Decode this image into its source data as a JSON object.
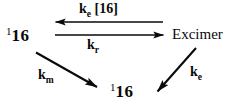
{
  "diagram": {
    "type": "reaction-scheme",
    "background_color": "#ffffff",
    "ink_color": "#0a0a0a",
    "width": 232,
    "height": 106,
    "species": {
      "left": {
        "superscript": "1",
        "body": "16"
      },
      "right": {
        "text": "Excimer"
      },
      "bottom": {
        "superscript": "1",
        "body": "16"
      }
    },
    "rate_labels": {
      "excimer_formation": {
        "symbol": "k",
        "subscript": "e",
        "bracket": "[16]"
      },
      "excimer_dissociation": {
        "symbol": "k",
        "subscript": "r"
      },
      "monomer_decay": {
        "symbol": "k",
        "subscript": "m"
      },
      "excimer_decay": {
        "symbol": "k",
        "subscript": "e"
      }
    },
    "arrows": [
      {
        "name": "arrow-excimer-to-monomer",
        "direction": "left",
        "x1": 163,
        "y1": 22,
        "x2": 55,
        "y2": 22
      },
      {
        "name": "arrow-monomer-to-excimer",
        "direction": "right",
        "x1": 55,
        "y1": 35,
        "x2": 164,
        "y2": 35
      },
      {
        "name": "arrow-monomer-decay",
        "direction": "down-right",
        "x1": 36,
        "y1": 52,
        "x2": 98,
        "y2": 88
      },
      {
        "name": "arrow-excimer-decay",
        "direction": "down-left",
        "x1": 196,
        "y1": 48,
        "x2": 156,
        "y2": 93
      }
    ]
  }
}
